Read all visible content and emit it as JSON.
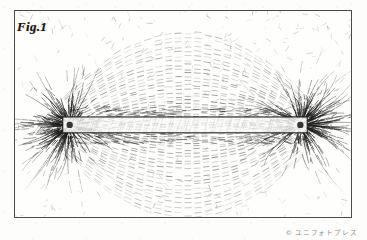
{
  "figure": {
    "label": "Fig.1",
    "caption_present": false,
    "medium": "halftone engraving / scanned print",
    "background_color": "#fdfdfc",
    "ink_color": "#1d1d1b",
    "frame": {
      "present": true,
      "color": "#4a4a47",
      "x": 14,
      "y": 10,
      "width": 338,
      "height": 208
    }
  },
  "credit": {
    "mark": "©",
    "text": "ユニフォトプレス",
    "color": "#8d8d89"
  },
  "chart_data": {
    "type": "scatter",
    "title": "Fig.1",
    "xlabel": "",
    "ylabel": "",
    "xlim": [
      0,
      338
    ],
    "ylim": [
      0,
      208
    ],
    "grid": false,
    "legend": null,
    "annotations": [
      "Fig.1",
      "© ユニフォトプレス"
    ],
    "magnet": {
      "shape": "rectangular bar",
      "x1": 48,
      "y1": 107,
      "x2": 294,
      "y2": 123,
      "fill": "#fbfbfa",
      "stroke": "#1d1d1b",
      "poles": [
        {
          "name": "left-pole",
          "cx": 55,
          "cy": 115,
          "r": 3.2
        },
        {
          "name": "right-pole",
          "cx": 287,
          "cy": 115,
          "r": 3.2
        }
      ]
    },
    "series": [
      {
        "name": "radial-filings-left-pole",
        "center_x": 55,
        "center_y": 115,
        "count": 150,
        "inner_r": 6,
        "outer_r": 78
      },
      {
        "name": "radial-filings-right-pole",
        "center_x": 287,
        "center_y": 115,
        "count": 150,
        "inner_r": 6,
        "outer_r": 78
      },
      {
        "name": "arc-filings-above",
        "count": 26,
        "direction": "above-bar"
      },
      {
        "name": "arc-filings-below",
        "count": 26,
        "direction": "below-bar"
      },
      {
        "name": "sparse-corner-stipple",
        "count": 420
      }
    ]
  }
}
